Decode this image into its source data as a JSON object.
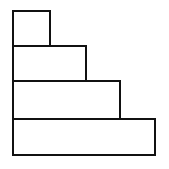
{
  "diagram": {
    "title": "",
    "stroke_color": "#111111",
    "fill_color": "#ffffff",
    "blocks": [
      {
        "name": "block-1",
        "x": 12,
        "y": 10,
        "width": 39,
        "height": 37
      },
      {
        "name": "block-2",
        "x": 12,
        "y": 45,
        "width": 75,
        "height": 37
      },
      {
        "name": "block-3",
        "x": 12,
        "y": 80,
        "width": 109,
        "height": 40
      },
      {
        "name": "block-4",
        "x": 12,
        "y": 118,
        "width": 144,
        "height": 38
      }
    ]
  }
}
